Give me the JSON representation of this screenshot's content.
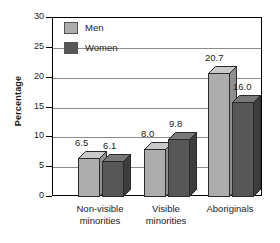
{
  "chart_data": {
    "type": "bar",
    "title": "",
    "xlabel": "",
    "ylabel": "Percentage",
    "ylim": [
      0,
      30
    ],
    "yticks": [
      0,
      5,
      10,
      15,
      20,
      25,
      30
    ],
    "ytick_labels": [
      "0",
      "5",
      "10",
      "15",
      "20",
      "25",
      "30"
    ],
    "grid": "horizontal",
    "legend_position": "top-left-inside",
    "categories": [
      "Non-visible minorities",
      "Visible minorities",
      "Aboriginals"
    ],
    "category_lines": [
      [
        "Non-visible",
        "minorities"
      ],
      [
        "Visible",
        "minorities"
      ],
      [
        "Aboriginals"
      ]
    ],
    "series": [
      {
        "name": "Men",
        "color": "#adadad",
        "values": [
          6.5,
          8.0,
          20.7
        ],
        "labels": [
          "6.5",
          "8.0",
          "20.7"
        ]
      },
      {
        "name": "Women",
        "color": "#575757",
        "values": [
          6.1,
          9.8,
          16.0
        ],
        "labels": [
          "6.1",
          "9.8",
          "16.0"
        ]
      }
    ]
  },
  "legend": {
    "items": [
      {
        "label": "Men",
        "color": "#adadad"
      },
      {
        "label": "Women",
        "color": "#575757"
      }
    ]
  },
  "axes": {
    "y_title": "Percentage"
  },
  "colors": {
    "men_face": "#adadad",
    "men_top": "#c9c9c9",
    "men_side": "#8f8f8f",
    "women_face": "#575757",
    "women_top": "#787878",
    "women_side": "#3d3d3d",
    "frame": "#000000",
    "gridline": "#8c8c8c",
    "text": "#1a1a1a"
  }
}
